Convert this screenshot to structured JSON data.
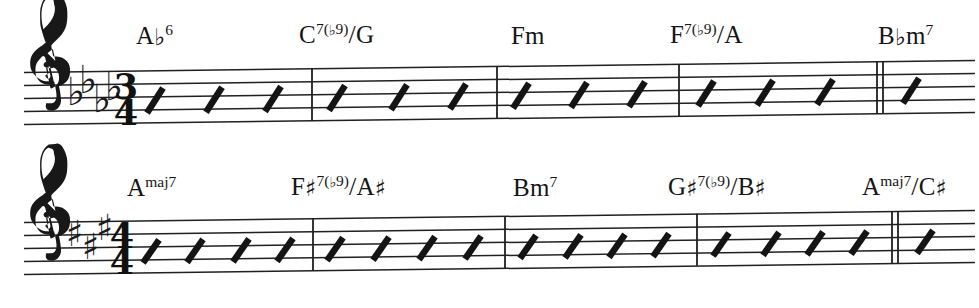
{
  "document": {
    "kind": "music-lead-sheet",
    "background_color": "#ffffff",
    "ink_color": "#151515",
    "systems_count": 2
  },
  "systems": [
    {
      "id": "system-1",
      "clef": "treble-clef",
      "key_signature": {
        "accidental": "flat",
        "glyph": "♭",
        "count": 4,
        "key_name": "A♭ major"
      },
      "time_signature": {
        "numerator": "3",
        "denominator": "4",
        "display": "3/4"
      },
      "measures": [
        {
          "index": 1,
          "beats": 3,
          "chord": "A♭6"
        },
        {
          "index": 2,
          "beats": 3,
          "chord": "C7(♭9)/G"
        },
        {
          "index": 3,
          "beats": 3,
          "chord": "Fm"
        },
        {
          "index": 4,
          "beats": 3,
          "chord": "F7(♭9)/A"
        },
        {
          "index": 5,
          "beats": 1,
          "chord": "B♭m7"
        }
      ],
      "chords": [
        {
          "id": "chord-1-1",
          "text": "A♭6",
          "root": "A",
          "root_accidental": "♭",
          "quality": "6",
          "bass": "",
          "x": 136
        },
        {
          "id": "chord-1-2",
          "text": "C7(♭9)/G",
          "root": "C",
          "root_accidental": "",
          "quality": "7(♭9)",
          "bass": "G",
          "x": 299
        },
        {
          "id": "chord-1-3",
          "text": "Fm",
          "root": "F",
          "root_accidental": "",
          "quality": "m",
          "bass": "",
          "x": 511
        },
        {
          "id": "chord-1-4",
          "text": "F7(♭9)/A",
          "root": "F",
          "root_accidental": "",
          "quality": "7(♭9)",
          "bass": "A",
          "x": 670
        },
        {
          "id": "chord-1-5",
          "text": "B♭m7",
          "root": "B",
          "root_accidental": "♭",
          "quality": "m7",
          "bass": "",
          "x": 878
        }
      ],
      "barlines": [
        {
          "x": 312,
          "type": "single"
        },
        {
          "x": 497,
          "type": "single"
        },
        {
          "x": 679,
          "type": "single"
        },
        {
          "x": 880,
          "type": "double"
        }
      ],
      "slash_groups": [
        {
          "measure": 1,
          "count": 3,
          "xs": [
            152,
            211,
            270
          ]
        },
        {
          "measure": 2,
          "count": 3,
          "xs": [
            334,
            396,
            455
          ]
        },
        {
          "measure": 3,
          "count": 3,
          "xs": [
            518,
            576,
            634
          ]
        },
        {
          "measure": 4,
          "count": 3,
          "xs": [
            703,
            762,
            822
          ]
        },
        {
          "measure": 5,
          "count": 1,
          "xs": [
            908
          ]
        }
      ]
    },
    {
      "id": "system-2",
      "clef": "treble-clef",
      "key_signature": {
        "accidental": "sharp",
        "glyph": "♯",
        "count": 3,
        "key_name": "A major"
      },
      "time_signature": {
        "numerator": "4",
        "denominator": "4",
        "display": "4/4"
      },
      "measures": [
        {
          "index": 1,
          "beats": 4,
          "chord": "Amaj7"
        },
        {
          "index": 2,
          "beats": 4,
          "chord": "F♯7(♭9)/A♯"
        },
        {
          "index": 3,
          "beats": 4,
          "chord": "Bm7"
        },
        {
          "index": 4,
          "beats": 4,
          "chord": "G♯7(♭9)/B♯"
        },
        {
          "index": 5,
          "beats": 1,
          "chord": "Amaj7/C♯"
        }
      ],
      "chords": [
        {
          "id": "chord-2-1",
          "text": "Amaj7",
          "root": "A",
          "root_accidental": "",
          "quality": "maj7",
          "bass": "",
          "x": 127
        },
        {
          "id": "chord-2-2",
          "text": "F♯7(♭9)/A♯",
          "root": "F",
          "root_accidental": "♯",
          "quality": "7(♭9)",
          "bass": "A♯",
          "x": 291
        },
        {
          "id": "chord-2-3",
          "text": "Bm7",
          "root": "B",
          "root_accidental": "",
          "quality": "m7",
          "bass": "",
          "x": 513
        },
        {
          "id": "chord-2-4",
          "text": "G♯7(♭9)/B♯",
          "root": "G",
          "root_accidental": "♯",
          "quality": "7(♭9)",
          "bass": "B♯",
          "x": 668
        },
        {
          "id": "chord-2-5",
          "text": "Amaj7/C♯",
          "root": "A",
          "root_accidental": "",
          "quality": "maj7",
          "bass": "C♯",
          "x": 862
        }
      ],
      "barlines": [
        {
          "x": 313,
          "type": "single"
        },
        {
          "x": 505,
          "type": "single"
        },
        {
          "x": 697,
          "type": "single"
        },
        {
          "x": 895,
          "type": "double"
        }
      ],
      "slash_groups": [
        {
          "measure": 1,
          "count": 4,
          "xs": [
            148,
            192,
            238,
            282
          ]
        },
        {
          "measure": 2,
          "count": 4,
          "xs": [
            332,
            378,
            424,
            470
          ]
        },
        {
          "measure": 3,
          "count": 4,
          "xs": [
            525,
            570,
            614,
            658
          ]
        },
        {
          "measure": 4,
          "count": 4,
          "xs": [
            718,
            768,
            812,
            856
          ]
        },
        {
          "measure": 5,
          "count": 1,
          "xs": [
            922
          ]
        }
      ]
    }
  ]
}
